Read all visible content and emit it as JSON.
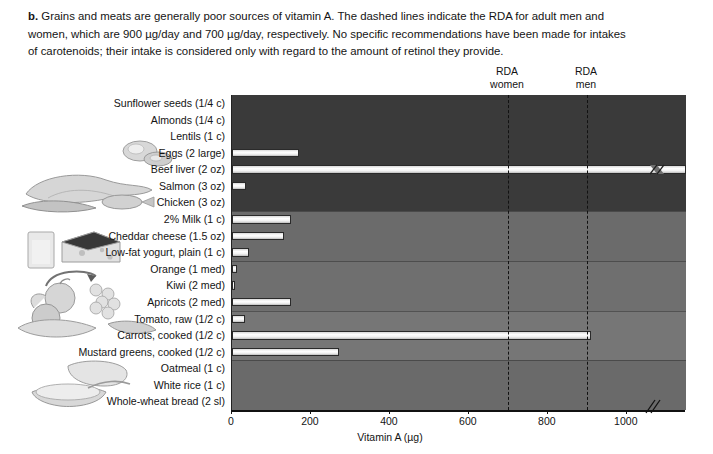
{
  "caption": {
    "lead": "b.",
    "text": "Grains and meats are generally poor sources of vitamin A. The dashed lines indicate the RDA for adult men and women, which are 900 µg/day and 700 µg/day, respectively. No specific recommendations have been made for intakes of carotenoids; their intake is considered only with regard to the amount of retinol they provide."
  },
  "annotations": {
    "rda_women_line1": "RDA",
    "rda_women_line2": "women",
    "rda_men_line1": "RDA",
    "rda_men_line2": "men"
  },
  "chart_data": {
    "type": "bar",
    "orientation": "horizontal",
    "title": "",
    "xlabel": "Vitamin A (µg)",
    "ylabel": "",
    "xlim": [
      0,
      1150
    ],
    "xticks": [
      0,
      200,
      400,
      600,
      800,
      1000
    ],
    "xticklabels": [
      "0",
      "200",
      "400",
      "600",
      "800",
      "1000"
    ],
    "axis_break": true,
    "grid": false,
    "legend": null,
    "categories": [
      "Sunflower seeds (1/4 c)",
      "Almonds (1/4 c)",
      "Lentils (1 c)",
      "Eggs (2 large)",
      "Beef liver (2 oz)",
      "Salmon (3 oz)",
      "Chicken (3 oz)",
      "2% Milk (1 c)",
      "Cheddar cheese (1.5 oz)",
      "Low-fat yogurt, plain (1 c)",
      "Orange (1 med)",
      "Kiwi (2 med)",
      "Apricots (2 med)",
      "Tomato, raw (1/2 c)",
      "Carrots, cooked (1/2 c)",
      "Mustard greens, cooked (1/2 c)",
      "Oatmeal (1 c)",
      "White rice (1 c)",
      "Whole-wheat bread (2 sl)"
    ],
    "values": [
      0,
      0,
      0,
      170,
      1150,
      35,
      0,
      150,
      132,
      43,
      12,
      8,
      150,
      33,
      910,
      270,
      0,
      0,
      0
    ],
    "value_truncated": [
      false,
      false,
      false,
      false,
      true,
      false,
      false,
      false,
      false,
      false,
      false,
      false,
      false,
      false,
      false,
      false,
      false,
      false,
      false
    ],
    "reference_lines": [
      {
        "name": "RDA women",
        "value": 700
      },
      {
        "name": "RDA men",
        "value": 900
      }
    ],
    "groups": [
      {
        "name": "protein",
        "from": 0,
        "to": 6,
        "shade": "#3a3a3a"
      },
      {
        "name": "dairy",
        "from": 7,
        "to": 9,
        "shade": "#6b6b6b"
      },
      {
        "name": "fruits",
        "from": 10,
        "to": 12,
        "shade": "#6f6f6f"
      },
      {
        "name": "vegetables",
        "from": 13,
        "to": 15,
        "shade": "#767676"
      },
      {
        "name": "grains",
        "from": 16,
        "to": 18,
        "shade": "#6a6a6a"
      }
    ]
  },
  "icons": {
    "eggs": "eggs-illustration",
    "poultry": "poultry-fish-illustration",
    "cheese": "cheese-milk-illustration",
    "produce": "fruits-vegetables-illustration",
    "grains": "bread-oatmeal-illustration"
  }
}
